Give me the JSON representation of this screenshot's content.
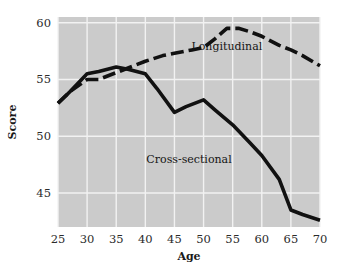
{
  "chart_data": {
    "type": "line",
    "title": "",
    "xlabel": "Age",
    "ylabel": "Score",
    "xlim": [
      25,
      70
    ],
    "ylim": [
      42,
      60.5
    ],
    "xticks": [
      25,
      30,
      35,
      40,
      45,
      50,
      55,
      60,
      65,
      70
    ],
    "yticks": [
      45,
      50,
      55,
      60
    ],
    "grid": true,
    "legend_position": "inline-annotation",
    "plot_background": "#cbcbcb",
    "line_color": "#111111",
    "gridline_color": "#f2f2f2",
    "series": [
      {
        "name": "Longitudinal",
        "style": "dashed",
        "label_x": 54,
        "label_y": 57.6,
        "x": [
          25,
          27,
          30,
          32,
          35,
          38,
          40,
          43,
          45,
          48,
          50,
          52,
          54,
          56,
          58,
          60,
          63,
          65,
          67,
          70
        ],
        "values": [
          52.9,
          53.9,
          55.0,
          55.0,
          55.6,
          56.2,
          56.6,
          57.1,
          57.3,
          57.6,
          57.8,
          58.6,
          59.5,
          59.5,
          59.2,
          58.8,
          58.0,
          57.6,
          57.1,
          56.2
        ]
      },
      {
        "name": "Cross-sectional",
        "style": "solid",
        "label_x": 47.5,
        "label_y": 47.6,
        "x": [
          25,
          27,
          30,
          32,
          35,
          37,
          40,
          42,
          45,
          47,
          50,
          52,
          55,
          58,
          60,
          63,
          65,
          67,
          70
        ],
        "values": [
          52.9,
          53.9,
          55.5,
          55.7,
          56.1,
          55.9,
          55.5,
          54.2,
          52.1,
          52.6,
          53.2,
          52.3,
          51.0,
          49.4,
          48.3,
          46.2,
          43.5,
          43.1,
          42.6
        ]
      }
    ]
  },
  "axis": {
    "y_title": "Score",
    "x_title": "Age"
  }
}
